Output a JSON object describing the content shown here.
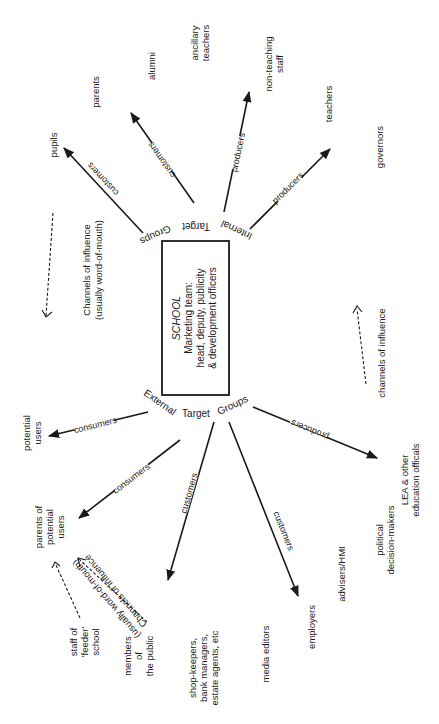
{
  "diagram": {
    "center": {
      "title": "SCHOOL",
      "line1": "Marketing team:",
      "line2": "head, deputy, publicity",
      "line3": "& development officers"
    },
    "groups": {
      "internal": {
        "w1": "Internal",
        "w2": "Target",
        "w3": "Groups"
      },
      "external": {
        "w1": "External",
        "w2": "Target",
        "w3": "Groups"
      }
    },
    "nodes": {
      "pupils": "pupils",
      "parents": "parents",
      "alumni": "alumni",
      "ancillary_teachers": [
        "ancillary",
        "teachers"
      ],
      "non_teaching_staff": [
        "non-teaching",
        "staff"
      ],
      "teachers": "teachers",
      "governors": "governors",
      "potential_users": [
        "potential",
        "users"
      ],
      "parents_of_potential_users": [
        "parents of",
        "potential",
        "users"
      ],
      "staff_feeder_school": [
        "staff of",
        "'feeder'",
        "school"
      ],
      "members_of_public": [
        "members",
        "of",
        "the public"
      ],
      "shop_keepers": [
        "shop-keepers,",
        "bank managers,",
        "estate agents, etc"
      ],
      "media_editors": "media editors",
      "employers": "employers",
      "advisers_hmi": "advisers/HMI",
      "political_decision_makers": [
        "political",
        "decision-makers"
      ],
      "lea_officials": [
        "LEA & other",
        "education officals"
      ]
    },
    "edges": {
      "to_pupils": "customers",
      "to_alumni": "customers",
      "to_non_teaching": "producers",
      "to_teachers": "producers",
      "to_potential_users": "consumers",
      "to_parents_potential": "consumers",
      "to_shop_keepers": "customers",
      "to_employers": "customers",
      "to_lea": "producers"
    },
    "influence": {
      "upper_left": [
        "Channels of influence",
        "(usually word-of-mouth)"
      ],
      "right": "channels of influence",
      "lower": [
        "Channels of influence",
        "(usually word-of-mouth)"
      ]
    }
  }
}
